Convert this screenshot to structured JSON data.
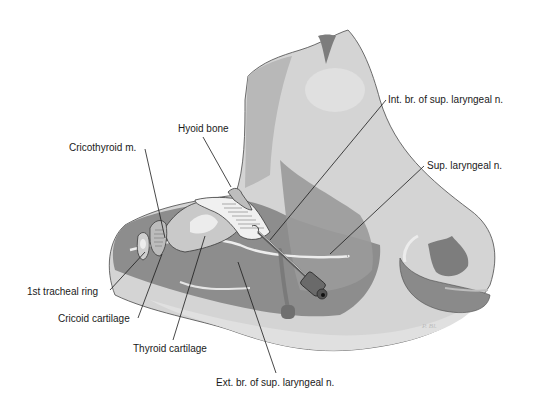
{
  "figure": {
    "colors": {
      "background": "#ffffff",
      "skin_light": "#d6d6d6",
      "skin_mid": "#bdbdbd",
      "tissue_dark": "#8f8f8f",
      "tissue_darker": "#7a7a7a",
      "highlight": "#e6e6e6",
      "outline": "#3a3a3a",
      "leader_line": "#1a1a1a"
    }
  },
  "labels": [
    {
      "id": "int-br",
      "text": "Int. br. of sup. laryngeal n."
    },
    {
      "id": "sup-laryngeal",
      "text": "Sup. laryngeal n."
    },
    {
      "id": "hyoid",
      "text": "Hyoid bone"
    },
    {
      "id": "cricothyroid",
      "text": "Cricothyroid m."
    },
    {
      "id": "tracheal-ring",
      "text": "1st tracheal ring"
    },
    {
      "id": "cricoid",
      "text": "Cricoid cartilage"
    },
    {
      "id": "thyroid",
      "text": "Thyroid cartilage"
    },
    {
      "id": "ext-br",
      "text": "Ext. br. of sup. laryngeal n."
    }
  ]
}
